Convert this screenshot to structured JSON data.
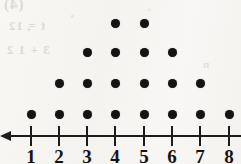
{
  "figure": {
    "kind": "dot-plot",
    "background_color": "#f7f6f3",
    "ink_color": "#141414",
    "axis_color": "#1c1c1c",
    "axis_arrow_direction": "left",
    "bleed_through_marks": [
      "(4)",
      "t = 12",
      "3 + 1 2",
      "n"
    ]
  },
  "chart_data": {
    "type": "bar",
    "title": "",
    "xlabel": "",
    "ylabel": "",
    "categories": [
      "1",
      "2",
      "3",
      "4",
      "5",
      "6",
      "7",
      "8"
    ],
    "values": [
      1,
      2,
      3,
      4,
      4,
      3,
      2,
      1
    ],
    "total_dots": 20,
    "ylim": [
      0,
      4
    ],
    "grid": false,
    "legend": "none",
    "rows": [
      {
        "level": 4,
        "positions": [
          4,
          5
        ]
      },
      {
        "level": 3,
        "positions": [
          3,
          4,
          5,
          6
        ]
      },
      {
        "level": 2,
        "positions": [
          2,
          3,
          4,
          5,
          6,
          7
        ]
      },
      {
        "level": 1,
        "positions": [
          1,
          2,
          3,
          4,
          5,
          6,
          7,
          8
        ]
      }
    ]
  },
  "axis": {
    "tick_labels": [
      "1",
      "2",
      "3",
      "4",
      "5",
      "6",
      "7",
      "8"
    ],
    "tick_x": [
      31,
      59,
      87,
      115,
      144,
      172,
      200,
      229
    ],
    "row_y": [
      23,
      52,
      83,
      114
    ],
    "line_y": 135,
    "dot_size": 9
  }
}
